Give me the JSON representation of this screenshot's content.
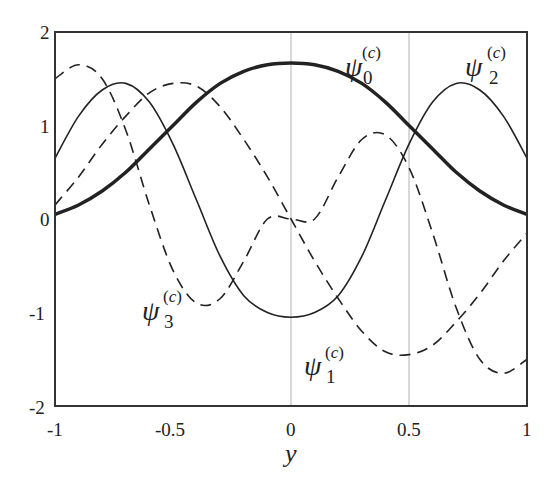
{
  "chart_data": {
    "type": "line",
    "title": "",
    "xlabel": "y",
    "ylabel": "",
    "xlim": [
      -1,
      1
    ],
    "ylim": [
      -2,
      2
    ],
    "x_ticks": [
      "-1",
      "-0.5",
      "0",
      "0.5",
      "1"
    ],
    "y_ticks": [
      "2",
      "1",
      "0",
      "-1",
      "-2"
    ],
    "grid": {
      "vertical_lines_at": [
        0,
        0.5
      ],
      "color": "#b0b0b0"
    },
    "legend": "inline labels",
    "x": [
      -1.0,
      -0.9,
      -0.8,
      -0.7,
      -0.6,
      -0.5,
      -0.4,
      -0.3,
      -0.2,
      -0.1,
      0.0,
      0.1,
      0.2,
      0.3,
      0.4,
      0.5,
      0.6,
      0.7,
      0.8,
      0.9,
      1.0
    ],
    "series": [
      {
        "name": "ψ0(c)",
        "style": "thick-solid",
        "values": [
          0.05,
          0.15,
          0.3,
          0.5,
          0.75,
          1.0,
          1.25,
          1.45,
          1.58,
          1.65,
          1.67,
          1.65,
          1.58,
          1.45,
          1.25,
          1.0,
          0.75,
          0.5,
          0.3,
          0.15,
          0.05
        ]
      },
      {
        "name": "ψ1(c)",
        "style": "dashed",
        "values": [
          0.15,
          0.45,
          0.8,
          1.1,
          1.35,
          1.45,
          1.42,
          1.2,
          0.85,
          0.45,
          0.0,
          -0.45,
          -0.85,
          -1.2,
          -1.42,
          -1.45,
          -1.35,
          -1.1,
          -0.8,
          -0.45,
          -0.15
        ]
      },
      {
        "name": "ψ2(c)",
        "style": "thin-solid",
        "values": [
          0.65,
          1.1,
          1.38,
          1.45,
          1.25,
          0.8,
          0.2,
          -0.4,
          -0.82,
          -1.0,
          -1.05,
          -1.0,
          -0.82,
          -0.4,
          0.2,
          0.8,
          1.25,
          1.45,
          1.38,
          1.1,
          0.65
        ]
      },
      {
        "name": "ψ3(c)",
        "style": "dashed",
        "values": [
          1.5,
          1.65,
          1.5,
          0.95,
          0.15,
          -0.55,
          -0.9,
          -0.85,
          -0.45,
          0.0,
          0.0,
          0.0,
          0.45,
          0.85,
          0.9,
          0.55,
          -0.15,
          -0.95,
          -1.5,
          -1.65,
          -1.5
        ]
      }
    ],
    "annotations": [
      {
        "text": "ψ0(c)",
        "x": 0.33,
        "y": 1.75
      },
      {
        "text": "ψ2(c)",
        "x": 0.78,
        "y": 1.75
      },
      {
        "text": "ψ3(c)",
        "x": -0.57,
        "y": -1.0
      },
      {
        "text": "ψ1(c)",
        "x": 0.08,
        "y": -1.55
      }
    ]
  },
  "labels": {
    "psi": "ψ",
    "sup": "(c)",
    "sup_open": "(",
    "sup_var": "c",
    "sup_close": ")",
    "sub0": "0",
    "sub1": "1",
    "sub2": "2",
    "sub3": "3",
    "xaxis": "y"
  }
}
